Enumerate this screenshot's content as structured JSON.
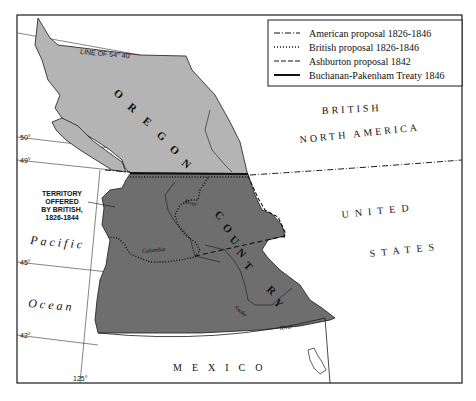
{
  "legend": {
    "items": [
      {
        "label": "American proposal 1826-1846",
        "style": "dash-dot"
      },
      {
        "label": "British proposal 1826-1846",
        "style": "dotted"
      },
      {
        "label": "Ashburton proposal 1842",
        "style": "dashed"
      },
      {
        "label": "Buchanan-Pakenham Treaty 1846",
        "style": "solid"
      }
    ]
  },
  "regions": {
    "oregon": [
      "O",
      "R",
      "E",
      "G",
      "O",
      "N"
    ],
    "country": [
      "C",
      "O",
      "U",
      "N",
      "T",
      "R",
      "Y"
    ],
    "british_line1": "BRITISH",
    "british_line2": "NORTH AMERICA",
    "united": "UNITED",
    "states": "STATES",
    "mexico": "MEXICO",
    "pacific": "Pacific",
    "ocean": "Ocean"
  },
  "annotations": {
    "line_54_40": "LINE OF 54° 40'",
    "territory_offered": [
      "TERRITORY",
      "OFFERED",
      "BY BRITISH,",
      "1826-1844"
    ]
  },
  "latitudes": [
    {
      "label": "50°",
      "y": 137
    },
    {
      "label": "49°",
      "y": 160
    },
    {
      "label": "45°",
      "y": 263
    },
    {
      "label": "42°",
      "y": 335
    }
  ],
  "longitude": {
    "label": "125°"
  },
  "rivers": {
    "columbia": "Columbia",
    "river_upper": "River",
    "snake": "Snake",
    "snake_river": "River"
  },
  "colors": {
    "north_region": "#b4b4b4",
    "south_region": "#6e6e6e",
    "outline": "#1a1a1a",
    "background": "#ffffff"
  }
}
